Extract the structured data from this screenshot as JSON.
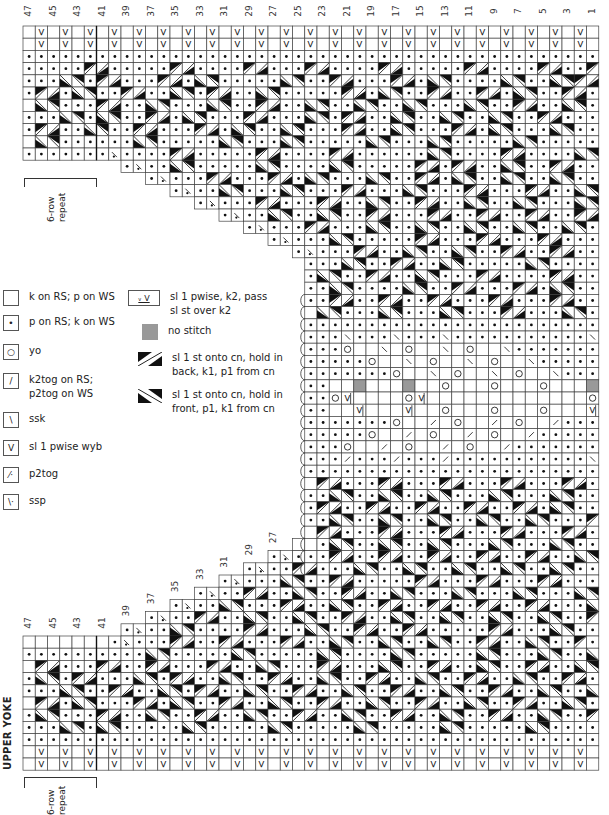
{
  "title": "UPPER YOKE",
  "repeat_label_line1": "6-row",
  "repeat_label_line2": "repeat",
  "top_column_labels": [
    "47",
    "45",
    "43",
    "41",
    "39",
    "37",
    "35",
    "33",
    "31",
    "29",
    "27",
    "25",
    "23",
    "21",
    "19",
    "17",
    "15",
    "13",
    "11",
    "9",
    "7",
    "5",
    "3",
    "1"
  ],
  "lower_column_labels": [
    "47",
    "45",
    "43",
    "41",
    "39",
    "37",
    "35",
    "33",
    "31",
    "29",
    "27"
  ],
  "legend": {
    "left": [
      {
        "symbol": "blank",
        "glyph": "",
        "label": "k on RS; p on WS"
      },
      {
        "symbol": "purl",
        "glyph": "•",
        "label": "p on RS; k on WS"
      },
      {
        "symbol": "yo",
        "glyph": "o",
        "label": "yo"
      },
      {
        "symbol": "k2tog",
        "glyph": "/",
        "label": "k2tog on RS;",
        "label2": "p2tog on WS"
      },
      {
        "symbol": "ssk",
        "glyph": "\\",
        "label": "ssk"
      },
      {
        "symbol": "slip",
        "glyph": "V",
        "label": "sl 1 pwise wyb"
      },
      {
        "symbol": "p2tog",
        "glyph": "⁄•",
        "label": "p2tog"
      },
      {
        "symbol": "ssp",
        "glyph": "\\•",
        "label": "ssp"
      }
    ],
    "right": [
      {
        "symbol": "sl1k2psso",
        "glyph": "ᵛ⁀V",
        "label": "sl 1 pwise, k2, pass",
        "label2": "sl st over k2"
      },
      {
        "symbol": "no-stitch",
        "glyph": "",
        "label": "no stitch"
      },
      {
        "symbol": "cable-back",
        "glyph": "",
        "label": "sl 1 st onto cn, hold in",
        "label2": "back, k1, p1 from cn"
      },
      {
        "symbol": "cable-front",
        "glyph": "",
        "label": "sl 1 st onto cn, hold in",
        "label2": "front, p1, k1 from cn"
      }
    ]
  },
  "chart_data": {
    "type": "table",
    "title": "UPPER YOKE",
    "columns": 47,
    "column_numbering": "47 (left) to 1 (right)",
    "symbol_key": {
      "x": "outside chart",
      "_": "k on RS; p on WS",
      ".": "p on RS; k on WS",
      "o": "yo",
      "/": "k2tog",
      "\\": "ssk",
      "v": "sl 1 pwise wyb",
      "p": "p2tog",
      "s": "ssp",
      "g": "no stitch",
      "w": "sl 1 pwise, k2, pass sl st over k2",
      "B": "cable back (k1, p1 from cn)",
      "F": "cable front (p1, k1 from cn)",
      "b": "cable back second half",
      "f": "cable front second half"
    },
    "rows": [
      "_v_v_v_v_v_v_v_v_v_v_v_v_v_v_v_v_v_v_v_v_v_v_v_",
      "_v_v_v_v_v_v_v_v_v_v_v_v_v_v_v_v_v_v_v_v_v_v_v_",
      "...............................................",
      ".....Bf.....Bf....Bf...Bf....Bf.....Bf....Bf..B",
      "...Fb.Bf...Bf.Fb.....Fb..Bf...Bf.Fb....Fb..FbBf.",
      ".Bf.Fb..Bf..Fb.Bf..Fb.....Bf.Fb..Bf..Bf.Fb..Bf..",
      "_Fb...Bf..Fb...Fb..Bf..Fb..Fb..Fb...Fb..Bf..Fb.",
      "...Fb.Fb..Bf.Fb...Bf...Fb.Bf..Fb..Fb..Fb..Bf...",
      ".Bf..Fb..Bf...Bf.Fb..Fb...Bf..Fb...Bf.Fb...Fb..",
      "_Fb......Fb.....Fb...Fb.....Fb...Fb.....Fb....",
      ".......p....Bf.....Bf....Bf......Fb....Bf....Fb",
      "xxxxxxxx.p..Fb.....Fb....Fb.....Bf.Bf..Fb..Bf..",
      "xxxxxxxxxx.p...Bf...Bf.Fb...Fb..Bf.Fb..Fb..Fb..",
      "xxxxxxxxxxxx.p..Fb...Fb...Bf...Fb...Bf...Bf..Fb",
      "xxxxxxxxxxxxxx.p...Bf...Bf..Fb..Bf..Fb..Fb...Fb.",
      "xxxxxxxxxxxxxxxx.p..Fb..Fb..Bf...Bf..Bf..Bf..Bf.",
      "xxxxxxxxxxxxxxxxxx.p...Bf...Fb..Fb..Fb..Fb..Fb..",
      "xxxxxxxxxxxxxxxxxxxx.p...Fb.....Bf...Bf...Bf....",
      "xxxxxxxxxxxxxxxxxxxxxx.p...Bf..Fb..Fb..Bf..Bf...",
      "xxxxxxxxxxxxxxxxxxxxxxx...Fb..Bf..Fb.....Fb.....",
      "xxxxxxxxxxxxxxxxxxxxxxx.Fb..Bf..Fb...Bf....Bf..Fb",
      "xxxxxxxxxxxxxxxxxxxxxxx..Fb....Fb..Bf...Bf.Fb...",
      "xxxxxxxxxxxxxxxxxxxxxxx..Bf..Bf..Bf...Bf...Bf..F",
      "xxxxxxxxxxxxxxxxxxxxxxx_Fb...Fb...Fb...Bf...Fb..",
      "xxxxxxxxxxxxxxxxxxxxxxx........................",
      "xxxxxxxxxxxxxxxxxxxxxxx...\\...\\...\\...........\\_",
      "xxxxxxxxxxxxxxxxxxxxxxx...o__\\_o__\\_o__\\.......o_\\",
      "xxxxxxxxxxxxxxxxxxxxxxx.....o__\\_o__\\_o__\\......o",
      "xxxxxxxxxxxxxxxxxxxxxxx.......o__\\_o__\\_o__\\.....",
      "xxxxxxxxxxxxxxxxxxxxxxx..__g___g__o___o___o___g__",
      "xxxxxxxxxxxxxxxxxxxxxxx..ow____ow_____________ow_",
      "xxxxxxxxxxxxxxxxxxxxxxx..__w___w__o___o___o___w__",
      "xxxxxxxxxxxxxxxxxxxxxxx.......o__/_o__/_o__/.....",
      "xxxxxxxxxxxxxxxxxxxxxxx.....o__/_o__/_o__/......o",
      "xxxxxxxxxxxxxxxxxxxxxxx...o__/_o__/_o__/.......o_/",
      "xxxxxxxxxxxxxxxxxxxxxxx.../.../.../...........\\_",
      "xxxxxxxxxxxxxxxxxxxxxxx........................",
      "xxxxxxxxxxxxxxxxxxxxxxx_Bf...Bf...Bf...Bf...Bf..",
      "xxxxxxxxxxxxxxxxxxxxxxx..Fb..Fb..Fb...Fb...Fb..B",
      "xxxxxxxxxxxxxxxxxxxxxxx.Bf..Bf..Bf..Bf..Bf.Fb..F",
      "xxxxxxxxxxxxxxxxxxxxxxx..Fb..Fb..Fb..Fb..Fb...Bf",
      "xxxxxxxxxxxxxxxxxxxxxxx_Bf...Bf...Bf...Bf...Bf..",
      "xxxxxxxxxxxxxxxxxxxxxx__.Fb..Fb..Fb...Fb...Fb..B",
      "xxxxxxxxxxxxxxxxxxxx.p...Bf..Bf..Bf..Bf..Bf..Fb.",
      "xxxxxxxxxxxxxxxxxx.p..Bf...Fb..Fb..Fb..Fb..Fb..F",
      "xxxxxxxxxxxxxxxx.p...Fb..Bf.....Bf...Bf...Bf...B",
      "xxxxxxxxxxxxxx.p..Bf..Fb..Bf..Fb...Fb...Fb...Fb.",
      "xxxxxxxxxxxx.p..Fb...Bf..Fb..Bf..Bf..Bf..Bf...F",
      "xxxxxxxxxx.p..Bf..Fb..Fb..Bf..Fb..Fb..Fb..Fb..Bf",
      "xxxxxxxx.p..Fb....Bf...Fb..Bf..Bf.....Bf...Fb..",
      "_______.p...Bf..Bf...Bf..Fb..Fb..Fb..Bf..Fb..B.",
      "..........Fb.....Fb.....Fb....Fb.....Fb...Fb..F",
      "_Bf...Bf..Bf...Bf..Fb...Bf...Fb..Bf..Fb..Bf..Fb",
      ".Fb.Bf...Fb.Bf..Fb..Bf..Fb..Bf..Fb..Bf..Fb..Bf.",
      "...Fb..Bf..Fb.Bf..Fb..Bf..Fb..Bf..Fb..Bf..Fb..F",
      "_Bf.Fb...Bf.Fb..Bf..Fb..Bf..Fb..Bf..Fb..Bf..Fb.",
      ".Fb...Bf..Fb..Bf..Fb..Bf..Fb..Bf..Fb..Bf..Fb..B",
      "...Fb.Fb.....Fb.....Fb.....Fb.....Fb.....Fb.....",
      "...............................................",
      "_v_v_v_v_v_v_v_v_v_v_v_v_v_v_v_v_v_v_v_v_v_v_v_",
      "_v_v_v_v_v_v_v_v_v_v_v_v_v_v_v_v_v_v_v_v_v_v_v_"
    ]
  }
}
